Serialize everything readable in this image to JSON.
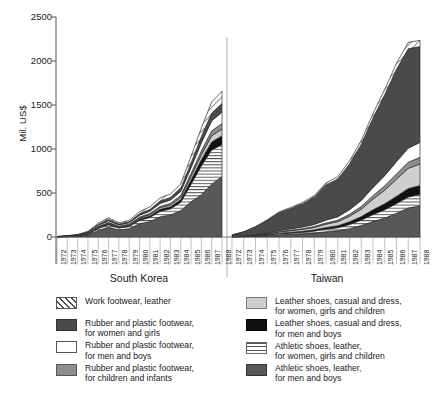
{
  "chart_data": {
    "type": "area",
    "title": "",
    "subtitle": "",
    "xlabel": "",
    "ylabel": "Mil. US$",
    "ylim": [
      0,
      2500
    ],
    "yticks": [
      0,
      500,
      1000,
      1500,
      2000,
      2500
    ],
    "ytick_labels": [
      "0",
      "500",
      "1000",
      "1500",
      "2000",
      "2500"
    ],
    "grid": false,
    "legend_position": "below",
    "stacked": true,
    "panels": [
      {
        "name": "South Korea",
        "x": [
          1972,
          1973,
          1974,
          1975,
          1976,
          1977,
          1978,
          1979,
          1980,
          1981,
          1982,
          1983,
          1984,
          1985,
          1986,
          1987,
          1988
        ],
        "xtick_labels": [
          "1972",
          "1973",
          "1974",
          "1975",
          "1976",
          "1977",
          "1978",
          "1979",
          "1980",
          "1981",
          "1982",
          "1983",
          "1984",
          "1985",
          "1986",
          "1987",
          "1988"
        ],
        "series": [
          {
            "name": "Athletic shoes, leather, for men and boys",
            "values": [
              2,
              4,
              8,
              22,
              75,
              110,
              80,
              95,
              150,
              175,
              230,
              250,
              300,
              400,
              480,
              600,
              690
            ]
          },
          {
            "name": "Athletic shoes, leather, for women, girls and children",
            "values": [
              1,
              2,
              4,
              10,
              22,
              30,
              22,
              26,
              40,
              48,
              62,
              70,
              95,
              200,
              330,
              390,
              360
            ]
          },
          {
            "name": "Leather shoes, casual and dress, for men and boys",
            "values": [
              0,
              1,
              2,
              4,
              8,
              10,
              8,
              9,
              14,
              17,
              22,
              24,
              30,
              50,
              70,
              90,
              100
            ]
          },
          {
            "name": "Leather shoes, casual and dress, for women, girls and children",
            "values": [
              0,
              1,
              2,
              4,
              7,
              9,
              7,
              8,
              12,
              15,
              19,
              21,
              26,
              40,
              55,
              70,
              78
            ]
          },
          {
            "name": "Rubber and plastic footwear, for children and infants",
            "values": [
              0,
              1,
              2,
              3,
              6,
              8,
              6,
              7,
              10,
              12,
              15,
              17,
              21,
              32,
              44,
              56,
              62
            ]
          },
          {
            "name": "Rubber and plastic footwear, for men and boys",
            "values": [
              1,
              2,
              4,
              8,
              14,
              18,
              14,
              16,
              22,
              26,
              34,
              38,
              46,
              68,
              92,
              115,
              128
            ]
          },
          {
            "name": "Rubber and plastic footwear, for women and girls",
            "values": [
              1,
              2,
              3,
              6,
              11,
              14,
              11,
              12,
              17,
              20,
              26,
              29,
              35,
              52,
              70,
              88,
              98
            ]
          },
          {
            "name": "Work footwear, leather",
            "values": [
              1,
              2,
              4,
              8,
              14,
              19,
              14,
              16,
              23,
              28,
              36,
              40,
              49,
              74,
              100,
              125,
              140
            ]
          }
        ],
        "totals": [
          6,
          15,
          29,
          65,
          157,
          218,
          162,
          189,
          288,
          341,
          444,
          489,
          602,
          916,
          1241,
          1534,
          1656
        ]
      },
      {
        "name": "Taiwan",
        "x": [
          1972,
          1973,
          1974,
          1975,
          1976,
          1977,
          1978,
          1979,
          1980,
          1981,
          1982,
          1983,
          1984,
          1985,
          1986,
          1987,
          1988
        ],
        "xtick_labels": [
          "1972",
          "1973",
          "1974",
          "1975",
          "1976",
          "1977",
          "1978",
          "1979",
          "1980",
          "1981",
          "1982",
          "1983",
          "1984",
          "1985",
          "1986",
          "1987",
          "1988"
        ],
        "series": [
          {
            "name": "Athletic shoes, leather, for men and boys",
            "values": [
              2,
              4,
              8,
              15,
              25,
              30,
              36,
              45,
              60,
              70,
              95,
              130,
              175,
              215,
              270,
              330,
              355
            ]
          },
          {
            "name": "Athletic shoes, leather, for women, girls and children",
            "values": [
              1,
              2,
              4,
              7,
              12,
              15,
              18,
              22,
              30,
              36,
              48,
              62,
              80,
              95,
              110,
              125,
              130
            ]
          },
          {
            "name": "Leather shoes, casual and dress, for men and boys",
            "values": [
              0,
              1,
              2,
              4,
              7,
              9,
              11,
              14,
              18,
              22,
              30,
              40,
              55,
              68,
              82,
              95,
              100
            ]
          },
          {
            "name": "Leather shoes, casual and dress, for women, girls and children",
            "values": [
              1,
              2,
              4,
              8,
              14,
              18,
              22,
              28,
              38,
              46,
              62,
              85,
              120,
              155,
              195,
              230,
              245
            ]
          },
          {
            "name": "Rubber and plastic footwear, for children and infants",
            "values": [
              0,
              1,
              2,
              3,
              5,
              7,
              8,
              10,
              14,
              17,
              23,
              30,
              40,
              50,
              60,
              70,
              75
            ]
          },
          {
            "name": "Rubber and plastic footwear, for men and boys",
            "values": [
              1,
              2,
              4,
              7,
              12,
              15,
              19,
              24,
              32,
              39,
              52,
              68,
              92,
              115,
              140,
              160,
              170
            ]
          },
          {
            "name": "Rubber and plastic footwear, for women and girls",
            "values": [
              18,
              45,
              90,
              145,
              200,
              230,
              265,
              310,
              400,
              430,
              520,
              640,
              790,
              920,
              1050,
              1130,
              1090
            ]
          },
          {
            "name": "Work footwear, leather",
            "values": [
              1,
              2,
              4,
              6,
              10,
              12,
              14,
              17,
              22,
              26,
              33,
              42,
              52,
              60,
              68,
              72,
              70
            ]
          }
        ],
        "totals": [
          24,
          59,
          118,
          195,
          285,
          336,
          393,
          470,
          614,
          686,
          863,
          1097,
          1404,
          1678,
          1975,
          2212,
          2235
        ]
      }
    ]
  },
  "axis": {
    "ylabel": "Mil. US$",
    "ytick_labels": [
      "2500",
      "2000",
      "1500",
      "1000",
      "500",
      "0"
    ]
  },
  "panels": {
    "left_title": "South Korea",
    "right_title": "Taiwan"
  },
  "legend": {
    "left": [
      {
        "pattern": "diagonal-hatch",
        "color": "#ffffff",
        "label": "Work footwear, leather"
      },
      {
        "pattern": "solid",
        "color": "#4a4a4a",
        "label": "Rubber and plastic footwear,\nfor women and girls"
      },
      {
        "pattern": "solid",
        "color": "#ffffff",
        "label": "Rubber and plastic footwear,\nfor men and boys"
      },
      {
        "pattern": "solid",
        "color": "#8e8e8e",
        "label": "Rubber and plastic footwear,\nfor children and infants"
      }
    ],
    "right": [
      {
        "pattern": "solid",
        "color": "#cfcfcf",
        "label": "Leather shoes, casual and dress,\nfor women, girls and children"
      },
      {
        "pattern": "solid",
        "color": "#111111",
        "label": "Leather shoes, casual and dress,\nfor men and boys"
      },
      {
        "pattern": "horizontal-lines",
        "color": "#ffffff",
        "label": "Athletic shoes, leather,\nfor women, girls and children"
      },
      {
        "pattern": "solid",
        "color": "#585858",
        "label": "Athletic shoes, leather,\nfor men and boys"
      }
    ]
  }
}
